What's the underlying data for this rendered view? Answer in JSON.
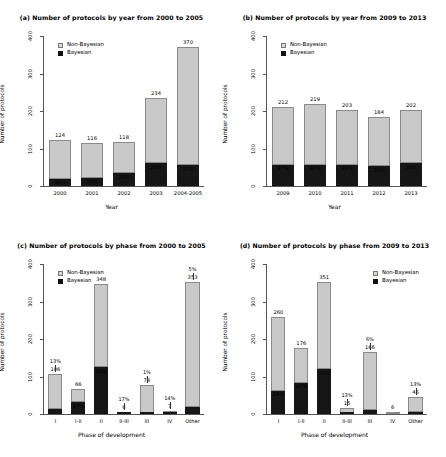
{
  "figure": {
    "axis": {
      "ylabel": "Number of protocols",
      "yticks": [
        "0",
        "100",
        "200",
        "300",
        "400"
      ],
      "ylim": [
        0,
        400
      ],
      "xlabel_year": "Year",
      "xlabel_phase": "Phase of development"
    },
    "legend": {
      "non_bayesian": "Non-Bayesian",
      "bayesian": "Bayesian",
      "color_non_bayesian": "#c9c9c9",
      "color_bayesian": "#161616"
    }
  },
  "chart_data": [
    {
      "type": "bar",
      "panel": "a",
      "title": "(a) Number of protocols by year from 2000 to 2005",
      "xlabel": "Year",
      "ylabel": "Number of protocols",
      "ylim": [
        0,
        400
      ],
      "legend_position": "top-left",
      "categories": [
        "2000",
        "2001",
        "2002",
        "2003",
        "2004-2005"
      ],
      "totals": [
        124,
        116,
        118,
        234,
        370
      ],
      "bayesian_pct": [
        "16%",
        "19%",
        "29%",
        "26%",
        "15%"
      ],
      "series": [
        {
          "name": "Bayesian",
          "values": [
            20,
            22,
            34,
            61,
            56
          ]
        },
        {
          "name": "Non-Bayesian",
          "values": [
            104,
            94,
            84,
            173,
            314
          ]
        }
      ]
    },
    {
      "type": "bar",
      "panel": "b",
      "title": "(b) Number of protocols by year from 2009 to 2013",
      "xlabel": "Year",
      "ylabel": "Number of protocols",
      "ylim": [
        0,
        400
      ],
      "legend_position": "top-left",
      "categories": [
        "2009",
        "2010",
        "2011",
        "2012",
        "2013"
      ],
      "totals": [
        212,
        219,
        203,
        184,
        202
      ],
      "bayesian_pct": [
        "27%",
        "26%",
        "28%",
        "29%",
        "30%"
      ],
      "series": [
        {
          "name": "Bayesian",
          "values": [
            57,
            57,
            57,
            53,
            61
          ]
        },
        {
          "name": "Non-Bayesian",
          "values": [
            155,
            162,
            146,
            131,
            141
          ]
        }
      ]
    },
    {
      "type": "bar",
      "panel": "c",
      "title": "(c) Number of protocols by phase from 2000 to 2005",
      "xlabel": "Phase of development",
      "ylabel": "Number of protocols",
      "ylim": [
        0,
        400
      ],
      "legend_position": "top-left",
      "categories": [
        "I",
        "I-II",
        "II",
        "II-III",
        "III",
        "IV",
        "Other"
      ],
      "totals": [
        106,
        66,
        348,
        6,
        78,
        7,
        353
      ],
      "bayesian_pct": [
        "13%",
        "47%",
        "36%",
        "17%",
        "1%",
        "14%",
        "5%"
      ],
      "series": [
        {
          "name": "Bayesian",
          "values": [
            14,
            31,
            125,
            1,
            1,
            1,
            18
          ]
        },
        {
          "name": "Non-Bayesian",
          "values": [
            92,
            35,
            223,
            5,
            77,
            6,
            335
          ]
        }
      ]
    },
    {
      "type": "bar",
      "panel": "d",
      "title": "(d) Number of protocols by phase from 2009 to 2013",
      "xlabel": "Phase of development",
      "ylabel": "Number of protocols",
      "ylim": [
        0,
        400
      ],
      "legend_position": "top-right",
      "categories": [
        "I",
        "I-II",
        "II",
        "II-III",
        "III",
        "IV",
        "Other"
      ],
      "totals": [
        260,
        176,
        351,
        15,
        166,
        6,
        46
      ],
      "bayesian_pct": [
        "24%",
        "47%",
        "34%",
        "13%",
        "6%",
        "",
        "13%"
      ],
      "series": [
        {
          "name": "Bayesian",
          "values": [
            62,
            83,
            119,
            2,
            10,
            0,
            6
          ]
        },
        {
          "name": "Non-Bayesian",
          "values": [
            198,
            93,
            232,
            13,
            156,
            6,
            40
          ]
        }
      ]
    }
  ]
}
